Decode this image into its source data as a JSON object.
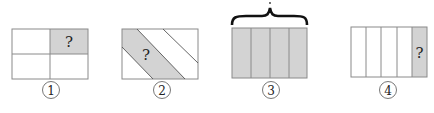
{
  "colors": {
    "stroke": "#8a8a8a",
    "shade": "#d3d3d3",
    "text": "#222222",
    "brace": "#111111"
  },
  "figures": [
    {
      "number": "1",
      "unknown": "?",
      "description": "Rectangle divided into 4 equal parts (2x2), top-right shaded"
    },
    {
      "number": "2",
      "unknown": "?",
      "description": "Rectangle with diagonal stripes, one diagonal band shaded"
    },
    {
      "number": "3",
      "unknown": "",
      "brace_mark": "?",
      "description": "Rectangle divided into 4 equal vertical strips, all shaded, with brace above"
    },
    {
      "number": "4",
      "unknown": "?",
      "description": "Rectangle divided into 5 equal vertical strips, rightmost shaded"
    }
  ]
}
